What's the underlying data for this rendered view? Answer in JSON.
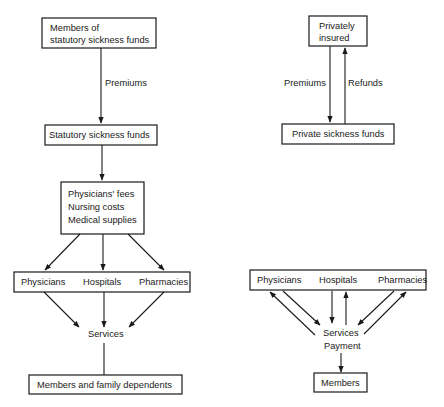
{
  "statutory": {
    "members": [
      "Members of",
      "statutory sickness funds"
    ],
    "premiums_label": "Premiums",
    "funds": "Statutory sickness funds",
    "costs": [
      "Physicians' fees",
      "Nursing costs",
      "Medical supplies"
    ],
    "providers": [
      "Physicians",
      "Hospitals",
      "Pharmacies"
    ],
    "services": "Services",
    "beneficiaries": "Members and family dependents"
  },
  "private": {
    "insured": [
      "Privately",
      "insured"
    ],
    "premiums_label": "Premiums",
    "refunds_label": "Refunds",
    "funds": "Private sickness funds",
    "providers": [
      "Physicians",
      "Hospitals",
      "Pharmacies"
    ],
    "services": "Services",
    "payment": "Payment",
    "members": "Members"
  }
}
